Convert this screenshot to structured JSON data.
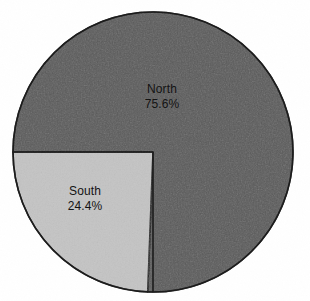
{
  "chart_data": {
    "type": "pie",
    "title": "",
    "subtitle": "",
    "xlabel": "",
    "ylabel": "",
    "categories": [
      "North",
      "South"
    ],
    "values": [
      75.6,
      24.4
    ],
    "value_unit": "%",
    "labels": [
      {
        "name": "North",
        "value": "75.6%",
        "percent": 75.6,
        "color": "#595959"
      },
      {
        "name": "South",
        "value": "24.4%",
        "percent": 24.4,
        "color": "#c4c4c4"
      }
    ],
    "legend": {
      "visible": false,
      "position": "none"
    },
    "grid": false,
    "start_angle_deg": 180,
    "direction": "clockwise",
    "labels_inside_slices": true,
    "annotations": []
  },
  "figure": {
    "background_color": "#ffffff",
    "outline_color": "#1a1a1a",
    "outline_width_px": 1.6,
    "center_x": 153,
    "center_y": 152,
    "radius": 140
  },
  "slices": {
    "north": {
      "name": "North",
      "value": "75.6%",
      "fill": "#595959"
    },
    "south": {
      "name": "South",
      "value": "24.4%",
      "fill": "#c4c4c4"
    }
  }
}
